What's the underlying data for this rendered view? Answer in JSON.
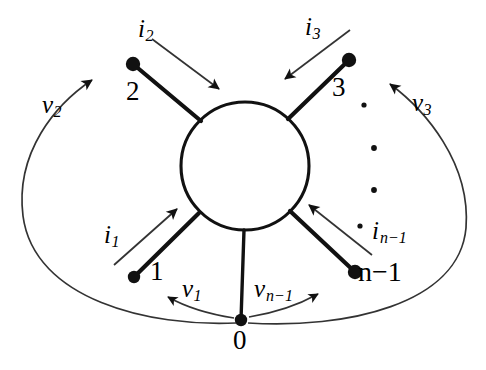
{
  "figure": {
    "type": "graph-diagram",
    "background_color": "#ffffff",
    "stroke_color": "#000000"
  },
  "hub": {
    "name": "central-circle",
    "cx": 245,
    "cy": 166,
    "r": 64
  },
  "nodes": [
    {
      "id": "n0",
      "label": "0",
      "x": 241,
      "y": 320,
      "label_x": 233,
      "label_y": 327
    },
    {
      "id": "n1",
      "label": "1",
      "x": 134,
      "y": 277,
      "label_x": 150,
      "label_y": 258
    },
    {
      "id": "n2",
      "label": "2",
      "x": 133,
      "y": 64,
      "label_x": 126,
      "label_y": 78
    },
    {
      "id": "n3",
      "label": "3",
      "x": 349,
      "y": 60,
      "label_x": 332,
      "label_y": 74
    },
    {
      "id": "nn1",
      "label": "n−1",
      "x": 355,
      "y": 272,
      "label_x": 358,
      "label_y": 258
    }
  ],
  "current_labels": [
    {
      "id": "i1",
      "base": "i",
      "sub": "1",
      "x": 104,
      "y": 222
    },
    {
      "id": "i2",
      "base": "i",
      "sub": "2",
      "x": 138,
      "y": 16
    },
    {
      "id": "i3",
      "base": "i",
      "sub": "3",
      "x": 305,
      "y": 14
    },
    {
      "id": "in1",
      "base": "i",
      "sub": "n−1",
      "x": 372,
      "y": 218
    }
  ],
  "voltage_labels": [
    {
      "id": "v1",
      "base": "v",
      "sub": "1",
      "x": 182,
      "y": 276
    },
    {
      "id": "v2",
      "base": "v",
      "sub": "2",
      "x": 42,
      "y": 92
    },
    {
      "id": "v3",
      "base": "v",
      "sub": "3",
      "x": 412,
      "y": 90
    },
    {
      "id": "vn1",
      "base": "v",
      "sub": "n−1",
      "x": 254,
      "y": 276
    }
  ],
  "ellipsis_dots": [
    {
      "x": 364,
      "y": 105,
      "r": 2.6
    },
    {
      "x": 374,
      "y": 148,
      "r": 2.9
    },
    {
      "x": 374,
      "y": 190,
      "r": 2.9
    },
    {
      "x": 360,
      "y": 226,
      "r": 2.6
    }
  ],
  "font_sizes": {
    "node_number": 27,
    "symbol": 25
  }
}
